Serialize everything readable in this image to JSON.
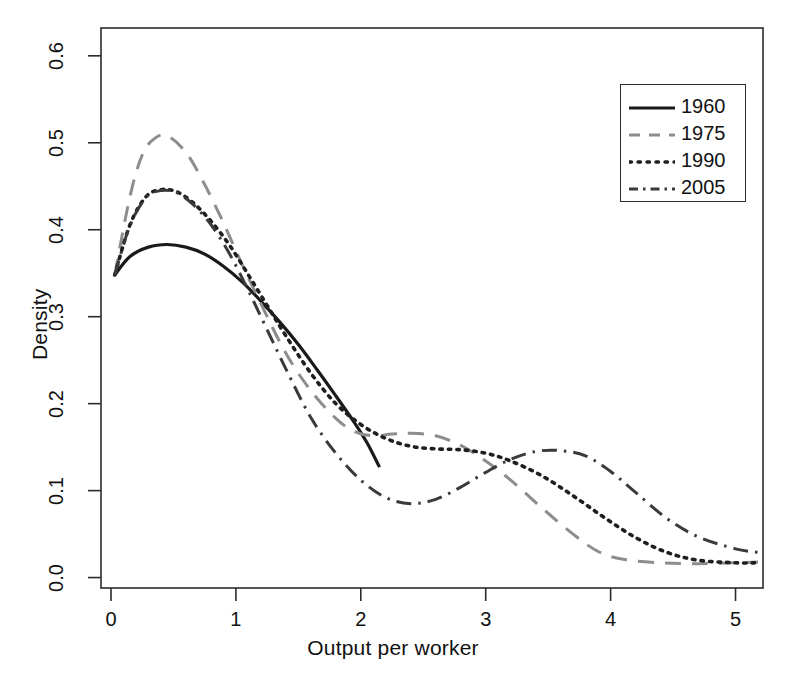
{
  "chart_data": {
    "type": "line",
    "title": "",
    "xlabel": "Output per worker",
    "ylabel": "Density",
    "xlim": [
      -0.08,
      5.22
    ],
    "ylim": [
      -0.012,
      0.632
    ],
    "xticks": [
      "0",
      "1",
      "2",
      "3",
      "4",
      "5"
    ],
    "xtick_values": [
      0,
      1,
      2,
      3,
      4,
      5
    ],
    "yticks": [
      "0.0",
      "0.1",
      "0.2",
      "0.3",
      "0.4",
      "0.5",
      "0.6"
    ],
    "ytick_values": [
      0.0,
      0.1,
      0.2,
      0.3,
      0.4,
      0.5,
      0.6
    ],
    "grid": false,
    "legend_position": "top-right",
    "box_frame": true,
    "series": [
      {
        "name": "1960",
        "style": "solid",
        "color": "#1a1a1a",
        "x": [
          0.03,
          0.15,
          0.3,
          0.45,
          0.6,
          0.75,
          0.9,
          1.05,
          1.2,
          1.35,
          1.5,
          1.65,
          1.8,
          1.95,
          2.05,
          2.15
        ],
        "y": [
          0.348,
          0.369,
          0.38,
          0.383,
          0.38,
          0.372,
          0.358,
          0.34,
          0.318,
          0.294,
          0.268,
          0.239,
          0.209,
          0.178,
          0.155,
          0.127
        ]
      },
      {
        "name": "1975",
        "style": "dashed",
        "color": "#8d8d8d",
        "x": [
          0.03,
          0.15,
          0.25,
          0.35,
          0.45,
          0.6,
          0.75,
          0.9,
          1.05,
          1.2,
          1.4,
          1.6,
          1.8,
          1.95,
          2.1,
          2.25,
          2.4,
          2.6,
          2.8,
          3.0,
          3.2,
          3.45,
          3.7,
          3.9,
          4.1,
          4.4,
          4.7,
          5.0,
          5.18
        ],
        "y": [
          0.348,
          0.437,
          0.486,
          0.505,
          0.508,
          0.489,
          0.452,
          0.408,
          0.36,
          0.315,
          0.258,
          0.215,
          0.183,
          0.168,
          0.163,
          0.165,
          0.166,
          0.163,
          0.152,
          0.134,
          0.112,
          0.08,
          0.05,
          0.03,
          0.021,
          0.017,
          0.016,
          0.017,
          0.018
        ]
      },
      {
        "name": "1990",
        "style": "dotted",
        "color": "#1f1f1f",
        "x": [
          0.03,
          0.15,
          0.28,
          0.4,
          0.52,
          0.65,
          0.8,
          0.95,
          1.1,
          1.25,
          1.4,
          1.6,
          1.8,
          2.0,
          2.2,
          2.4,
          2.6,
          2.8,
          3.0,
          3.2,
          3.45,
          3.7,
          3.95,
          4.2,
          4.45,
          4.7,
          5.0,
          5.18
        ],
        "y": [
          0.348,
          0.405,
          0.438,
          0.446,
          0.444,
          0.432,
          0.41,
          0.382,
          0.348,
          0.313,
          0.278,
          0.235,
          0.2,
          0.176,
          0.16,
          0.151,
          0.148,
          0.147,
          0.143,
          0.134,
          0.117,
          0.094,
          0.069,
          0.046,
          0.029,
          0.02,
          0.017,
          0.017
        ]
      },
      {
        "name": "2005",
        "style": "dashdot",
        "color": "#3a3a3a",
        "x": [
          0.03,
          0.15,
          0.28,
          0.4,
          0.52,
          0.65,
          0.8,
          0.95,
          1.1,
          1.25,
          1.4,
          1.6,
          1.8,
          2.0,
          2.2,
          2.4,
          2.6,
          2.8,
          3.0,
          3.2,
          3.4,
          3.6,
          3.8,
          4.0,
          4.2,
          4.45,
          4.7,
          5.0,
          5.18
        ],
        "y": [
          0.348,
          0.404,
          0.437,
          0.445,
          0.443,
          0.43,
          0.406,
          0.372,
          0.33,
          0.285,
          0.24,
          0.184,
          0.143,
          0.112,
          0.092,
          0.085,
          0.09,
          0.104,
          0.121,
          0.136,
          0.145,
          0.146,
          0.14,
          0.122,
          0.098,
          0.068,
          0.047,
          0.033,
          0.029
        ]
      }
    ]
  },
  "legend": {
    "entries": [
      {
        "label": "1960",
        "style": "solid"
      },
      {
        "label": "1975",
        "style": "dashed"
      },
      {
        "label": "1990",
        "style": "dotted"
      },
      {
        "label": "2005",
        "style": "dashdot"
      }
    ]
  }
}
